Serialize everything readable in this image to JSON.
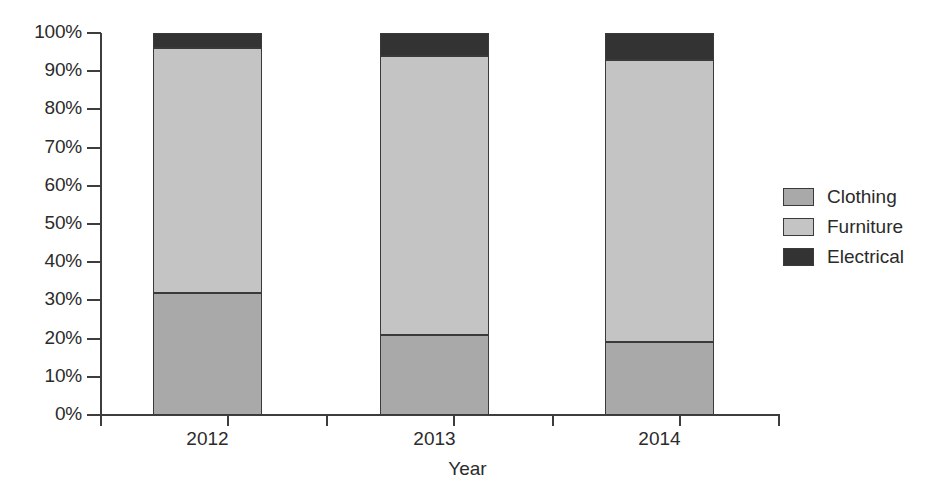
{
  "chart_data": {
    "type": "bar",
    "subtype": "stacked-100-percent",
    "title": "",
    "xlabel": "Year",
    "ylabel": "",
    "categories": [
      "2012",
      "2013",
      "2014"
    ],
    "series": [
      {
        "name": "Clothing",
        "color": "#a9a9a9",
        "values": [
          32,
          21,
          19
        ]
      },
      {
        "name": "Furniture",
        "color": "#c4c4c4",
        "values": [
          64,
          73,
          74
        ]
      },
      {
        "name": "Electrical",
        "color": "#333333",
        "values": [
          4,
          6,
          7
        ]
      }
    ],
    "cumulative_tops": [
      {
        "category": "2012",
        "clothing_top": 32,
        "furniture_top": 96,
        "electrical_top": 100
      },
      {
        "category": "2013",
        "clothing_top": 21,
        "furniture_top": 94,
        "electrical_top": 100
      },
      {
        "category": "2014",
        "clothing_top": 19,
        "furniture_top": 93,
        "electrical_top": 100
      }
    ],
    "ylim": [
      0,
      100
    ],
    "y_tick_labels": [
      "100%",
      "90%",
      "80%",
      "70%",
      "60%",
      "50%",
      "40%",
      "30%",
      "20%",
      "10%",
      "0%"
    ],
    "y_tick_values": [
      100,
      90,
      80,
      70,
      60,
      50,
      40,
      30,
      20,
      10,
      0
    ],
    "grid": false,
    "legend_position": "right",
    "value_unit": "percent"
  },
  "legend": {
    "items": [
      {
        "label": "Clothing",
        "color": "#a9a9a9"
      },
      {
        "label": "Furniture",
        "color": "#c4c4c4"
      },
      {
        "label": "Electrical",
        "color": "#333333"
      }
    ]
  },
  "axes": {
    "x_title": "Year",
    "x_categories": [
      "2012",
      "2013",
      "2014"
    ],
    "y_labels": [
      "100%",
      "90%",
      "80%",
      "70%",
      "60%",
      "50%",
      "40%",
      "30%",
      "20%",
      "10%",
      "0%"
    ]
  },
  "colors": {
    "clothing": "#a9a9a9",
    "furniture": "#c4c4c4",
    "electrical": "#333333",
    "axis": "#3d3d3d",
    "text": "#2b2b2b",
    "background": "#ffffff"
  }
}
